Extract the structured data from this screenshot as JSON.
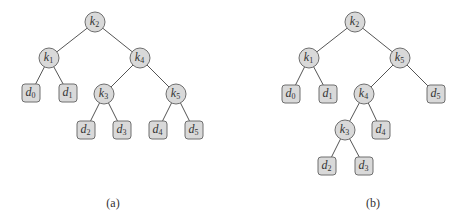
{
  "figures": [
    {
      "id": "a",
      "caption": "(a)",
      "caption_pos": [
        113,
        203
      ],
      "nodes": [
        {
          "id": "k2",
          "type": "key",
          "base": "k",
          "sub": "2",
          "x": 95,
          "y": 22
        },
        {
          "id": "k1",
          "type": "key",
          "base": "k",
          "sub": "1",
          "x": 49,
          "y": 58
        },
        {
          "id": "k4",
          "type": "key",
          "base": "k",
          "sub": "4",
          "x": 140,
          "y": 58
        },
        {
          "id": "d0",
          "type": "dummy",
          "base": "d",
          "sub": "0",
          "x": 31,
          "y": 93
        },
        {
          "id": "d1",
          "type": "dummy",
          "base": "d",
          "sub": "1",
          "x": 68,
          "y": 93
        },
        {
          "id": "k3",
          "type": "key",
          "base": "k",
          "sub": "3",
          "x": 104,
          "y": 94
        },
        {
          "id": "k5",
          "type": "key",
          "base": "k",
          "sub": "5",
          "x": 176,
          "y": 94
        },
        {
          "id": "d2",
          "type": "dummy",
          "base": "d",
          "sub": "2",
          "x": 86,
          "y": 130
        },
        {
          "id": "d3",
          "type": "dummy",
          "base": "d",
          "sub": "3",
          "x": 122,
          "y": 130
        },
        {
          "id": "d4",
          "type": "dummy",
          "base": "d",
          "sub": "4",
          "x": 158,
          "y": 130
        },
        {
          "id": "d5",
          "type": "dummy",
          "base": "d",
          "sub": "5",
          "x": 194,
          "y": 130
        }
      ],
      "edges": [
        [
          "k2",
          "k1"
        ],
        [
          "k2",
          "k4"
        ],
        [
          "k1",
          "d0"
        ],
        [
          "k1",
          "d1"
        ],
        [
          "k4",
          "k3"
        ],
        [
          "k4",
          "k5"
        ],
        [
          "k3",
          "d2"
        ],
        [
          "k3",
          "d3"
        ],
        [
          "k5",
          "d4"
        ],
        [
          "k5",
          "d5"
        ]
      ]
    },
    {
      "id": "b",
      "caption": "(b)",
      "caption_pos": [
        373,
        203
      ],
      "nodes": [
        {
          "id": "k2",
          "type": "key",
          "base": "k",
          "sub": "2",
          "x": 355,
          "y": 22
        },
        {
          "id": "k1",
          "type": "key",
          "base": "k",
          "sub": "1",
          "x": 309,
          "y": 58
        },
        {
          "id": "k5",
          "type": "key",
          "base": "k",
          "sub": "5",
          "x": 400,
          "y": 58
        },
        {
          "id": "d0",
          "type": "dummy",
          "base": "d",
          "sub": "0",
          "x": 291,
          "y": 94
        },
        {
          "id": "d1",
          "type": "dummy",
          "base": "d",
          "sub": "1",
          "x": 328,
          "y": 94
        },
        {
          "id": "k4",
          "type": "key",
          "base": "k",
          "sub": "4",
          "x": 364,
          "y": 94
        },
        {
          "id": "d5",
          "type": "dummy",
          "base": "d",
          "sub": "5",
          "x": 436,
          "y": 94
        },
        {
          "id": "k3",
          "type": "key",
          "base": "k",
          "sub": "3",
          "x": 345,
          "y": 130
        },
        {
          "id": "d4",
          "type": "dummy",
          "base": "d",
          "sub": "4",
          "x": 381,
          "y": 130
        },
        {
          "id": "d2",
          "type": "dummy",
          "base": "d",
          "sub": "2",
          "x": 327,
          "y": 166
        },
        {
          "id": "d3",
          "type": "dummy",
          "base": "d",
          "sub": "3",
          "x": 364,
          "y": 166
        }
      ],
      "edges": [
        [
          "k2",
          "k1"
        ],
        [
          "k2",
          "k5"
        ],
        [
          "k1",
          "d0"
        ],
        [
          "k1",
          "d1"
        ],
        [
          "k5",
          "k4"
        ],
        [
          "k5",
          "d5"
        ],
        [
          "k4",
          "k3"
        ],
        [
          "k4",
          "d4"
        ],
        [
          "k3",
          "d2"
        ],
        [
          "k3",
          "d3"
        ]
      ]
    }
  ],
  "style": {
    "node_fill": "#d9d9d9",
    "node_stroke": "#6e6e6e",
    "edge_color": "#555555",
    "key_radius": 10,
    "dummy_size": 18
  }
}
